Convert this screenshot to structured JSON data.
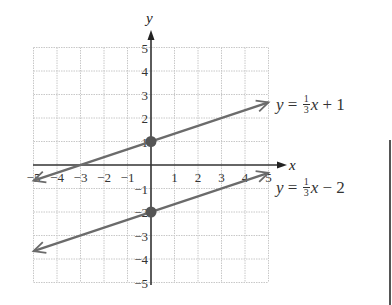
{
  "chart_data": {
    "type": "line",
    "title": "",
    "xlabel": "x",
    "ylabel": "y",
    "xlim": [
      -5,
      5
    ],
    "ylim": [
      -5,
      5
    ],
    "grid": true,
    "x_ticks": [
      -5,
      -4,
      -3,
      -2,
      -1,
      1,
      2,
      3,
      4,
      5
    ],
    "y_ticks": [
      -5,
      -4,
      -3,
      -2,
      -1,
      1,
      2,
      3,
      4,
      5
    ],
    "series": [
      {
        "name": "y = 1/3 x + 1",
        "slope": 0.3333,
        "intercept": 1,
        "x": [
          -5,
          5
        ],
        "y": [
          -0.667,
          2.667
        ],
        "marked_point": [
          0,
          1
        ],
        "arrows": "both"
      },
      {
        "name": "y = 1/3 x - 2",
        "slope": 0.3333,
        "intercept": -2,
        "x": [
          -5,
          5
        ],
        "y": [
          -3.667,
          -0.333
        ],
        "marked_point": [
          0,
          -2
        ],
        "arrows": "both"
      }
    ],
    "legend": "inline labels at right end of each line"
  },
  "labels": {
    "x_axis": "x",
    "y_axis": "y",
    "x_ticks": [
      "−5",
      "−4",
      "−3",
      "−2",
      "−1",
      "1",
      "2",
      "3",
      "4",
      "5"
    ],
    "y_ticks_pos": [
      "1",
      "2",
      "3",
      "4",
      "5"
    ],
    "y_ticks_neg": [
      "−1",
      "−2",
      "−3",
      "−4",
      "−5"
    ],
    "eq1": {
      "lhs": "y",
      "eqsign": " = ",
      "num": "1",
      "den": "3",
      "var": "x",
      "rest": " + 1"
    },
    "eq2": {
      "lhs": "y",
      "eqsign": " = ",
      "num": "1",
      "den": "3",
      "var": "x",
      "rest": " − 2"
    }
  },
  "colors": {
    "line": "#6b6b6b",
    "axis": "#333333",
    "grid": "#c8c8c8",
    "point": "#555555"
  }
}
